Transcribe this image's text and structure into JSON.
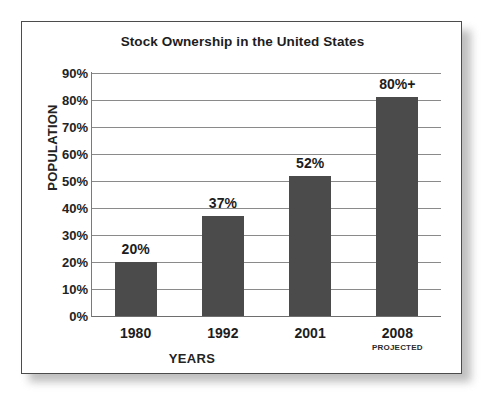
{
  "figure": {
    "title": "Stock Ownership in the United States"
  },
  "chart_data": {
    "type": "bar",
    "title": "Stock Ownership in the United States",
    "xlabel": "YEARS",
    "ylabel": "POPULATION",
    "categories": [
      "1980",
      "1992",
      "2001",
      "2008"
    ],
    "category_notes": [
      "",
      "",
      "",
      "PROJECTED"
    ],
    "values": [
      20,
      37,
      52,
      81
    ],
    "value_labels": [
      "20%",
      "37%",
      "52%",
      "80%+"
    ],
    "ylim": [
      0,
      90
    ],
    "ytick_values": [
      90,
      80,
      70,
      60,
      50,
      40,
      30,
      20,
      10,
      0
    ],
    "ytick_labels": [
      "90%",
      "80%",
      "70%",
      "60%",
      "50%",
      "40%",
      "30%",
      "20%",
      "10%",
      "0%"
    ],
    "grid": true,
    "legend": "none",
    "bar_color": "#4b4b4b",
    "grid_color": "#8a8a8a",
    "text_color": "#1d1d1d"
  },
  "artifacts": {
    "top_smudge": "·  ·   ·"
  }
}
